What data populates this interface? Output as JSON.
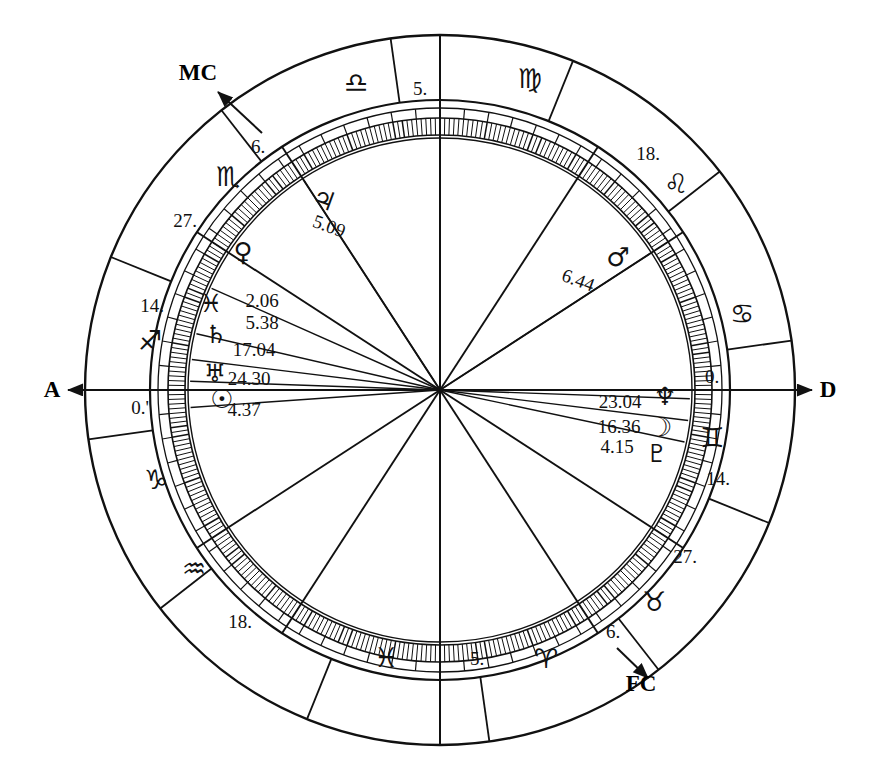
{
  "chart": {
    "kind": "astrological-natal-chart",
    "title": "",
    "center": {
      "x": 440,
      "y": 390
    },
    "radii": {
      "outer_rim": 355,
      "sign_band_inner": 290,
      "degree_ring_outer": 272,
      "degree_ring_inner": 255,
      "inner_disc": 252
    },
    "ink_color": "#111111",
    "background": "#ffffff"
  },
  "axes": [
    {
      "name": "ascendant",
      "label": "A",
      "label_x": 52,
      "label_y": 397,
      "arrow_from_x": 200,
      "arrow_from_y": 390,
      "arrow_to_x": 68,
      "arrow_to_y": 390,
      "interactable": false
    },
    {
      "name": "descendant",
      "label": "D",
      "label_x": 828,
      "label_y": 397,
      "arrow_from_x": 680,
      "arrow_from_y": 390,
      "arrow_to_x": 812,
      "arrow_to_y": 390,
      "interactable": false
    },
    {
      "name": "midheaven",
      "label": "MC",
      "label_x": 198,
      "label_y": 80,
      "arrow_from_x": 262,
      "arrow_from_y": 133,
      "arrow_to_x": 218,
      "arrow_to_y": 92,
      "interactable": false
    },
    {
      "name": "imum-coeli",
      "label": "FC",
      "label_x": 641,
      "label_y": 691,
      "arrow_from_x": 617,
      "arrow_from_y": 648,
      "arrow_to_x": 648,
      "arrow_to_y": 678,
      "interactable": false
    }
  ],
  "zodiac_signs": [
    {
      "name": "libra",
      "glyph": "♎",
      "x": 356,
      "y": 92,
      "size": 27,
      "rotate": 0
    },
    {
      "name": "virgo",
      "glyph": "♍",
      "x": 530,
      "y": 88,
      "size": 27,
      "rotate": 0
    },
    {
      "name": "leo",
      "glyph": "♌",
      "x": 676,
      "y": 193,
      "size": 27,
      "rotate": 0
    },
    {
      "name": "cancer",
      "glyph": "♋",
      "x": 742,
      "y": 323,
      "size": 27,
      "rotate": 0
    },
    {
      "name": "gemini",
      "glyph": "♊",
      "x": 712,
      "y": 447,
      "size": 27,
      "rotate": 0
    },
    {
      "name": "taurus",
      "glyph": "♉",
      "x": 654,
      "y": 611,
      "size": 27,
      "rotate": 0
    },
    {
      "name": "aries",
      "glyph": "♈",
      "x": 546,
      "y": 668,
      "size": 27,
      "rotate": 0
    },
    {
      "name": "pisces",
      "glyph": "♓",
      "x": 386,
      "y": 667,
      "size": 27,
      "rotate": 0
    },
    {
      "name": "aquarius",
      "glyph": "♒",
      "x": 194,
      "y": 578,
      "size": 27,
      "rotate": 0
    },
    {
      "name": "capricorn",
      "glyph": "♑",
      "x": 156,
      "y": 489,
      "size": 27,
      "rotate": 0
    },
    {
      "name": "sagittarius",
      "glyph": "♐",
      "x": 150,
      "y": 350,
      "size": 27,
      "rotate": 0
    },
    {
      "name": "scorpio",
      "glyph": "♏",
      "x": 228,
      "y": 186,
      "size": 27,
      "rotate": 0
    }
  ],
  "house_cusp_numbers": [
    {
      "name": "cusp-libra-5",
      "value": "5.",
      "x": 420,
      "y": 95
    },
    {
      "name": "cusp-leo-18",
      "value": "18.",
      "x": 648,
      "y": 160
    },
    {
      "name": "cusp-gemini-0",
      "value": "0.",
      "x": 712,
      "y": 383
    },
    {
      "name": "cusp-gemini-14",
      "value": "14.",
      "x": 718,
      "y": 485
    },
    {
      "name": "cusp-taurus-27",
      "value": "27.",
      "x": 685,
      "y": 563
    },
    {
      "name": "cusp-taurus-6",
      "value": "6.",
      "x": 613,
      "y": 638
    },
    {
      "name": "cusp-aries-5",
      "value": "5.",
      "x": 477,
      "y": 665
    },
    {
      "name": "cusp-aquarius-18",
      "value": "18.",
      "x": 240,
      "y": 628
    },
    {
      "name": "cusp-sagittarius-0",
      "value": "0.'",
      "x": 140,
      "y": 414
    },
    {
      "name": "cusp-sagittarius-14",
      "value": "14.",
      "x": 152,
      "y": 312
    },
    {
      "name": "cusp-scorpio-27",
      "value": "27.",
      "x": 185,
      "y": 227
    },
    {
      "name": "cusp-scorpio-6",
      "value": "6.",
      "x": 258,
      "y": 153
    }
  ],
  "planets": [
    {
      "name": "jupiter",
      "glyph": "♃",
      "degree_label": "5.09",
      "glyph_x": 321,
      "glyph_y": 208,
      "glyph_size": 26,
      "glyph_rotate": 20,
      "label_x": 327,
      "label_y": 232,
      "label_rotate": 20,
      "spoke_angle_deg": 123
    },
    {
      "name": "venus",
      "glyph": "♀",
      "degree_label": "2.06",
      "glyph_x": 243,
      "glyph_y": 261,
      "glyph_size": 26,
      "glyph_rotate": 0,
      "label_x": 262,
      "label_y": 307,
      "label_rotate": 0,
      "spoke_angle_deg": 156
    },
    {
      "name": "pisces-marker",
      "glyph": "♓",
      "degree_label": "5.38",
      "glyph_x": 211,
      "glyph_y": 312,
      "glyph_size": 25,
      "glyph_rotate": 0,
      "label_x": 262,
      "label_y": 329,
      "label_rotate": 0,
      "spoke_angle_deg": 167
    },
    {
      "name": "saturn",
      "glyph": "♄",
      "degree_label": "17.04",
      "glyph_x": 216,
      "glyph_y": 343,
      "glyph_size": 25,
      "glyph_rotate": 0,
      "label_x": 254,
      "label_y": 356,
      "label_rotate": 0,
      "spoke_angle_deg": 173
    },
    {
      "name": "uranus",
      "glyph": "♅",
      "degree_label": "24.30",
      "glyph_x": 215,
      "glyph_y": 382,
      "glyph_size": 25,
      "glyph_rotate": 0,
      "label_x": 249,
      "label_y": 385,
      "label_rotate": 0,
      "spoke_angle_deg": 178
    },
    {
      "name": "sun",
      "glyph": "☉",
      "degree_label": "4.37",
      "glyph_x": 222,
      "glyph_y": 408,
      "glyph_size": 26,
      "glyph_rotate": 0,
      "label_x": 244,
      "label_y": 416,
      "label_rotate": 0,
      "spoke_angle_deg": 184
    },
    {
      "name": "mars",
      "glyph": "♂",
      "degree_label": "6.44",
      "glyph_x": 618,
      "glyph_y": 266,
      "glyph_size": 26,
      "glyph_rotate": 0,
      "label_x": 576,
      "label_y": 286,
      "label_rotate": 20,
      "spoke_angle_deg": 33
    },
    {
      "name": "neptune",
      "glyph": "♆",
      "degree_label": "23.04",
      "glyph_x": 665,
      "glyph_y": 405,
      "glyph_size": 25,
      "glyph_rotate": 0,
      "label_x": 620,
      "label_y": 408,
      "label_rotate": 0,
      "spoke_angle_deg": 358
    },
    {
      "name": "moon",
      "glyph": "☽",
      "degree_label": "16.36",
      "glyph_x": 661,
      "glyph_y": 436,
      "glyph_size": 26,
      "glyph_rotate": 0,
      "label_x": 619,
      "label_y": 433,
      "label_rotate": 0,
      "spoke_angle_deg": 353
    },
    {
      "name": "pluto",
      "glyph": "♇",
      "degree_label": "4.15",
      "glyph_x": 657,
      "glyph_y": 462,
      "glyph_size": 25,
      "glyph_rotate": 0,
      "label_x": 617,
      "label_y": 453,
      "label_rotate": 0,
      "spoke_angle_deg": 348
    }
  ],
  "house_spokes_deg": [
    0,
    33,
    57,
    90,
    123,
    147,
    180,
    213,
    237,
    270,
    303,
    327
  ],
  "sign_divider_deg": [
    8,
    38,
    68,
    98,
    128,
    158,
    188,
    218,
    248,
    278,
    308,
    338
  ]
}
